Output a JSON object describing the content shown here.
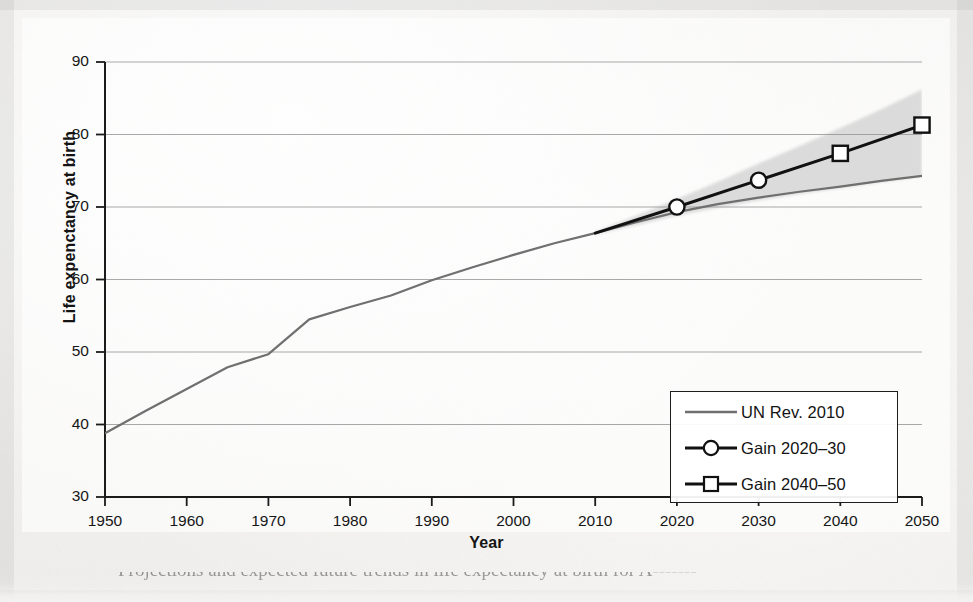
{
  "figure": {
    "caption_fragment": "Projections and expected future trends in life expectancy at birth for A-------"
  },
  "chart_data": {
    "type": "line",
    "title": "",
    "xlabel": "Year",
    "ylabel": "Life expenctancy at birth",
    "xlim": [
      1950,
      2050
    ],
    "ylim": [
      30,
      90
    ],
    "xticks": [
      1950,
      1960,
      1970,
      1980,
      1990,
      2000,
      2010,
      2020,
      2030,
      2040,
      2050
    ],
    "yticks": [
      30,
      40,
      50,
      60,
      70,
      80,
      90
    ],
    "grid": "horizontal",
    "legend_position": "lower right",
    "series": [
      {
        "name": "UN Rev. 2010",
        "color": "#6f6f6f",
        "marker": "none",
        "linewidth": 2.2,
        "x": [
          1950,
          1955,
          1960,
          1965,
          1970,
          1975,
          1980,
          1985,
          1990,
          1995,
          2000,
          2005,
          2010,
          2015,
          2020,
          2025,
          2030,
          2035,
          2040,
          2045,
          2050
        ],
        "values": [
          38.8,
          41.9,
          44.9,
          47.9,
          49.7,
          54.5,
          56.2,
          57.8,
          59.9,
          61.7,
          63.4,
          65.0,
          66.4,
          67.9,
          69.3,
          70.4,
          71.3,
          72.1,
          72.8,
          73.6,
          74.3
        ]
      },
      {
        "name": "Gain 2020-30",
        "color": "#111111",
        "marker": "circle",
        "linewidth": 3.0,
        "x": [
          2010,
          2020,
          2030
        ],
        "values": [
          66.4,
          70.0,
          73.7
        ]
      },
      {
        "name": "Gain 2040-50",
        "color": "#111111",
        "marker": "square",
        "linewidth": 3.0,
        "x": [
          2030,
          2040,
          2050
        ],
        "values": [
          73.7,
          77.4,
          81.3
        ]
      }
    ],
    "uncertainty_band": {
      "name": "projection uncertainty",
      "color": "#d6d6d6",
      "x": [
        2010,
        2015,
        2020,
        2025,
        2030,
        2035,
        2040,
        2045,
        2050
      ],
      "upper": [
        66.6,
        68.8,
        71.1,
        73.5,
        76.0,
        78.4,
        80.9,
        83.5,
        86.2
      ],
      "lower": [
        66.2,
        67.5,
        68.8,
        69.9,
        70.9,
        71.8,
        72.6,
        73.4,
        74.2
      ]
    },
    "markers": [
      {
        "series": "Gain 2020-30",
        "x": 2020,
        "y": 70.0,
        "shape": "circle"
      },
      {
        "series": "Gain 2020-30",
        "x": 2030,
        "y": 73.7,
        "shape": "circle"
      },
      {
        "series": "Gain 2040-50",
        "x": 2040,
        "y": 77.4,
        "shape": "square"
      },
      {
        "series": "Gain 2040-50",
        "x": 2050,
        "y": 81.3,
        "shape": "square"
      }
    ]
  },
  "legend": {
    "items": [
      {
        "label": "UN Rev. 2010",
        "marker": "none",
        "color": "#6f6f6f"
      },
      {
        "label": "Gain 2020–30",
        "marker": "circle",
        "color": "#111111"
      },
      {
        "label": "Gain 2040–50",
        "marker": "square",
        "color": "#111111"
      }
    ]
  },
  "axes": {
    "y_tick_labels": [
      "90",
      "80",
      "70",
      "60",
      "50",
      "40",
      "30"
    ],
    "x_tick_labels": [
      "1950",
      "1960",
      "1970",
      "1980",
      "1990",
      "2000",
      "2010",
      "2020",
      "2030",
      "2040",
      "2050"
    ],
    "x_title": "Year",
    "y_title": "Life expenctancy at birth"
  }
}
